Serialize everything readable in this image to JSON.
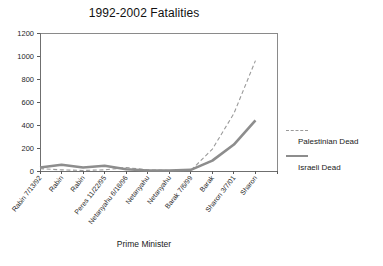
{
  "chart_data": {
    "type": "line",
    "title": "1992-2002 Fatalities",
    "xlabel": "Prime Minister",
    "ylabel": "",
    "ylim": [
      0,
      1200
    ],
    "yticks": [
      0,
      200,
      400,
      600,
      800,
      1000,
      1200
    ],
    "grid": false,
    "legend_position": "right",
    "categories": [
      "Rabin 7/13/92",
      "Rabin",
      "Rabin",
      "Peres 11/22/95",
      "Netanyahu 6/18/96",
      "Netanyahu",
      "Netanyahu",
      "Barak 7/6/99",
      "Barak",
      "Sharon 3/7/01",
      "Sharon",
      ""
    ],
    "series": [
      {
        "name": "Palestinian Dead",
        "style": "dashed",
        "color": "#9a9a9a",
        "values": [
          20,
          10,
          5,
          10,
          30,
          10,
          5,
          5,
          190,
          500,
          960,
          null
        ]
      },
      {
        "name": "Israeli Dead",
        "style": "solid",
        "color": "#8d8d8d",
        "values": [
          30,
          55,
          30,
          45,
          15,
          5,
          5,
          10,
          90,
          230,
          440,
          null
        ]
      }
    ]
  },
  "legend": {
    "entries": [
      {
        "label": "Palestinian Dead"
      },
      {
        "label": "Israeli Dead"
      }
    ]
  }
}
